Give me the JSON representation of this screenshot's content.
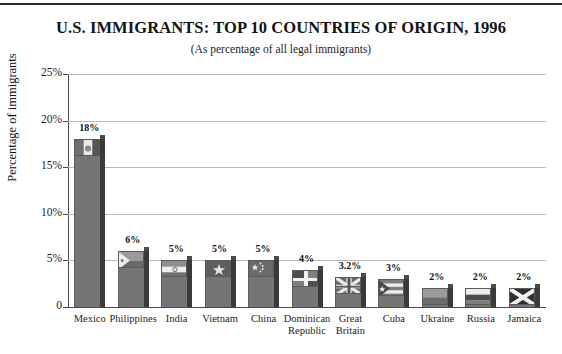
{
  "chart_data": {
    "type": "bar",
    "title": "U.S. IMMIGRANTS: TOP 10 COUNTRIES OF ORIGIN, 1996",
    "subtitle": "(As percentage of all legal immigrants)",
    "xlabel": "",
    "ylabel": "Percentage of immigrants",
    "ylim": [
      0,
      25
    ],
    "grid": true,
    "legend": "none",
    "y_ticks": [
      "0",
      "5%",
      "10%",
      "15%",
      "20%",
      "25%"
    ],
    "y_tick_values": [
      0,
      5,
      10,
      15,
      20,
      25
    ],
    "categories": [
      "Mexico",
      "Philippines",
      "India",
      "Vietnam",
      "China",
      "Dominican Republic",
      "Great Britain",
      "Cuba",
      "Ukraine",
      "Russia",
      "Jamaica"
    ],
    "values": [
      18,
      6,
      5,
      5,
      5,
      4,
      3.2,
      3,
      2,
      2,
      2
    ],
    "data_labels": [
      "18%",
      "6%",
      "5%",
      "5%",
      "5%",
      "4%",
      "3.2%",
      "3%",
      "2%",
      "2%",
      "2%"
    ],
    "bar_flag_icons": [
      "flag-mexico-icon",
      "flag-philippines-icon",
      "flag-india-icon",
      "flag-vietnam-icon",
      "flag-china-icon",
      "flag-dominican-republic-icon",
      "flag-great-britain-icon",
      "flag-cuba-icon",
      "flag-ukraine-icon",
      "flag-russia-icon",
      "flag-jamaica-icon"
    ],
    "colors": {
      "bar_face": "#757575",
      "bar_side": "#3a3a3a",
      "gridline": "#b9b9b9",
      "axis": "#4a4a4a",
      "text": "#1a1a1a",
      "background": "#ffffff"
    }
  },
  "x_tick_lines": [
    [
      "Mexico",
      ""
    ],
    [
      "Philippines",
      ""
    ],
    [
      "India",
      ""
    ],
    [
      "Vietnam",
      ""
    ],
    [
      "China",
      ""
    ],
    [
      "Dominican",
      "Republic"
    ],
    [
      "Great",
      "Britain"
    ],
    [
      "Cuba",
      ""
    ],
    [
      "Ukraine",
      ""
    ],
    [
      "Russia",
      ""
    ],
    [
      "Jamaica",
      ""
    ]
  ]
}
